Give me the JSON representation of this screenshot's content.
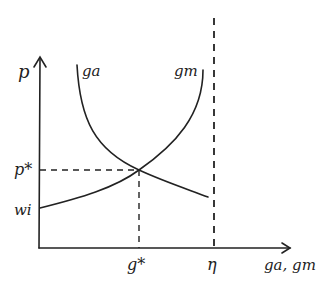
{
  "diagram": {
    "type": "economic-equilibrium-sketch",
    "style": "hand-drawn",
    "colors": {
      "ink": "#222222",
      "background": "#ffffff"
    },
    "axes": {
      "y_label": "p",
      "x_label": "ga, gm"
    },
    "curves": [
      {
        "id": "ga",
        "label": "ga",
        "shape": "downward-sloping convex",
        "start_near_y_axis": "top",
        "end": "right of g* near η"
      },
      {
        "id": "gm",
        "label": "gm",
        "shape": "upward-sloping convex",
        "start_at_y_axis": "wi",
        "asymptote": "η"
      }
    ],
    "y_ticks": [
      {
        "label": "p*",
        "role": "equilibrium price"
      },
      {
        "label": "wi",
        "role": "intercept of gm"
      }
    ],
    "x_ticks": [
      {
        "label": "g*",
        "role": "equilibrium quantity"
      },
      {
        "label": "η",
        "role": "vertical asymptote (dashed)"
      }
    ],
    "equilibrium": {
      "x_label": "g*",
      "y_label": "p*"
    }
  }
}
